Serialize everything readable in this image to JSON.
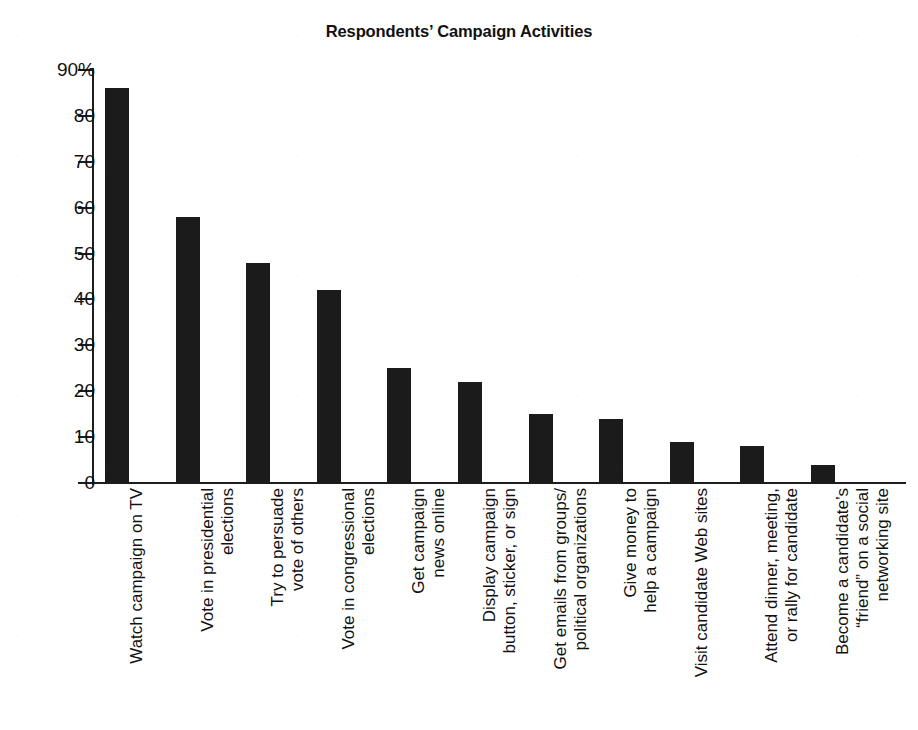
{
  "chart_data": {
    "type": "bar",
    "title": "Respondents’ Campaign Activities",
    "xlabel": "",
    "ylabel": "",
    "ylim": [
      0,
      90
    ],
    "grid": false,
    "legend": null,
    "y_tick_labels": [
      "90%",
      "80",
      "70",
      "60",
      "50",
      "40",
      "30",
      "20",
      "10",
      "0"
    ],
    "y_tick_values": [
      90,
      80,
      70,
      60,
      50,
      40,
      30,
      20,
      10,
      0
    ],
    "categories": [
      "Watch campaign on TV",
      "Vote in presidential\nelections",
      "Try to persuade\nvote of others",
      "Vote in congressional\nelections",
      "Get campaign\nnews online",
      "Display campaign\nbutton, sticker, or sign",
      "Get emails from groups/\npolitical organizations",
      "Give money to\nhelp a campaign",
      "Visit candidate Web sites",
      "Attend dinner, meeting,\nor rally for candidate",
      "Become a candidate’s\n“friend” on a social\nnetworking site"
    ],
    "values": [
      86,
      58,
      48,
      42,
      25,
      22,
      15,
      14,
      9,
      8,
      4
    ],
    "bar_color": "#1b1b1b",
    "background_color": "#ffffff",
    "axis_color": "#1d1d1d"
  }
}
